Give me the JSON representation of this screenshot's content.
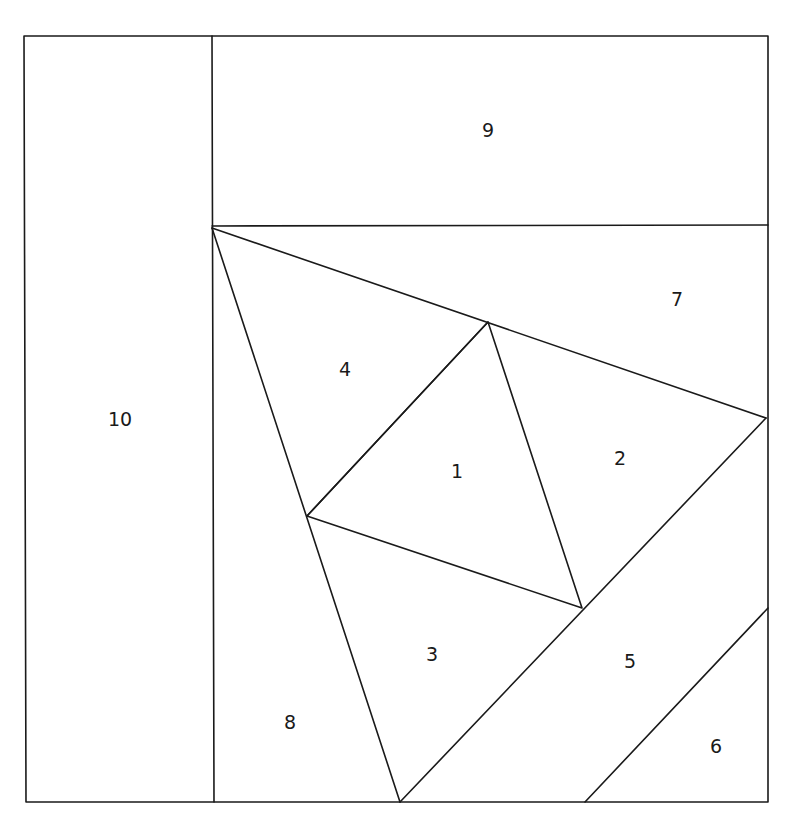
{
  "diagram": {
    "type": "paper-piecing quilt block pattern",
    "stroke_color": "#1a1a1a",
    "background": "#ffffff",
    "pieces": [
      {
        "id": "1",
        "label": "1",
        "x": 457,
        "y": 472
      },
      {
        "id": "2",
        "label": "2",
        "x": 620,
        "y": 459
      },
      {
        "id": "3",
        "label": "3",
        "x": 432,
        "y": 655
      },
      {
        "id": "4",
        "label": "4",
        "x": 345,
        "y": 370
      },
      {
        "id": "5",
        "label": "5",
        "x": 630,
        "y": 662
      },
      {
        "id": "6",
        "label": "6",
        "x": 716,
        "y": 747
      },
      {
        "id": "7",
        "label": "7",
        "x": 677,
        "y": 300
      },
      {
        "id": "8",
        "label": "8",
        "x": 290,
        "y": 723
      },
      {
        "id": "9",
        "label": "9",
        "x": 488,
        "y": 131
      },
      {
        "id": "10",
        "label": "10",
        "x": 120,
        "y": 420
      }
    ]
  }
}
